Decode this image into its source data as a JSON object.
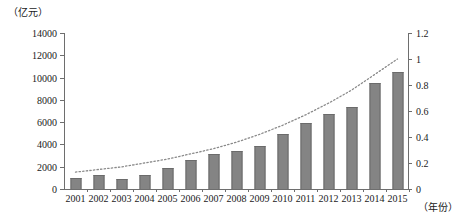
{
  "chart_data": {
    "type": "bar",
    "title": "",
    "subtitle": "",
    "xlabel": "(年份)",
    "ylabel": "(亿元)",
    "y2label": "",
    "grid": false,
    "legend": "none",
    "categories": [
      "2001",
      "2002",
      "2003",
      "2004",
      "2005",
      "2006",
      "2007",
      "2008",
      "2009",
      "2010",
      "2011",
      "2012",
      "2013",
      "2014",
      "2015"
    ],
    "ylim": [
      0,
      14000
    ],
    "yticks": [
      0,
      2000,
      4000,
      6000,
      8000,
      10000,
      12000,
      14000
    ],
    "ytick_labels": [
      "0",
      "2000",
      "4000",
      "6000",
      "8000",
      "10000",
      "12000",
      "14000"
    ],
    "y2lim": [
      0,
      1.2
    ],
    "y2ticks": [
      0,
      0.2,
      0.4,
      0.6,
      0.8,
      1.0,
      1.2
    ],
    "y2tick_labels": [
      "0",
      "0.2",
      "0.4",
      "0.6",
      "0.8",
      "1",
      "1.2"
    ],
    "series": [
      {
        "name": "bars",
        "type": "bar",
        "axis": "left",
        "color": "#848484",
        "values": [
          1000,
          1300,
          900,
          1300,
          1900,
          2600,
          3100,
          3400,
          3900,
          4900,
          5900,
          6700,
          7400,
          9500,
          10500
        ]
      },
      {
        "name": "trend",
        "type": "line",
        "style": "dotted",
        "axis": "right",
        "color": "#8a8a8a",
        "values": [
          0.13,
          0.15,
          0.17,
          0.2,
          0.23,
          0.27,
          0.31,
          0.36,
          0.42,
          0.49,
          0.57,
          0.66,
          0.76,
          0.88,
          1.0
        ]
      }
    ]
  },
  "axes": {
    "left_unit": "（亿元）",
    "bottom_unit": "（年份）"
  }
}
